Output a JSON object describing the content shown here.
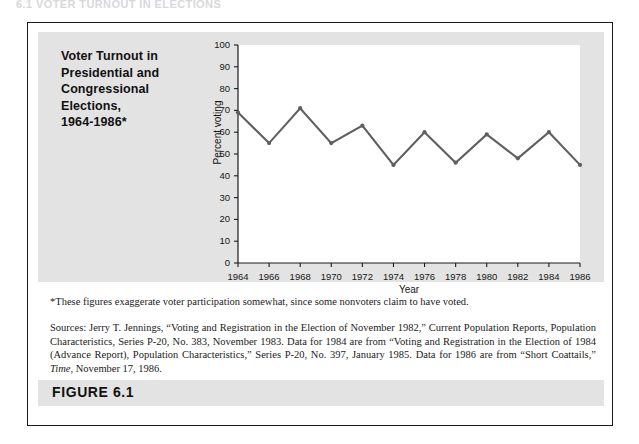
{
  "running_header": "6.1   VOTER TURNOUT IN ELECTIONS",
  "figure": {
    "caption": "FIGURE 6.1",
    "title_lines": [
      "Voter Turnout in",
      "Presidential and",
      "Congressional",
      "Elections,",
      "1964-1986*"
    ],
    "footnote": "*These figures exaggerate voter participation somewhat, since some nonvoters claim to have voted.",
    "sources_prefix": "Sources: Jerry T. Jennings, “Voting and Registration in the Election of November 1982,” Current Population Reports, Population Characteristics, Series P-20, No. 383, November 1983. Data for 1984 are from “Voting and Registration in the Election of 1984 (Advance Report), Population Characteristics,” Series P-20, No. 397, January 1985. Data for 1986 are from “Short Coattails,” ",
    "sources_italic": "Time",
    "sources_suffix": ", November 17, 1986."
  },
  "colors": {
    "panel_gray": "#e3e3e3",
    "line": "#5f5f5f",
    "axis": "#1a1a1a",
    "plot_background": "#ffffff",
    "page_background": "#ffffff"
  },
  "chart_data": {
    "type": "line",
    "title": "Voter Turnout in Presidential and Congressional Elections, 1964-1986*",
    "xlabel": "Year",
    "ylabel": "Percent voting",
    "x": [
      1964,
      1966,
      1968,
      1970,
      1972,
      1974,
      1976,
      1978,
      1980,
      1982,
      1984,
      1986
    ],
    "values": [
      69,
      55,
      71,
      55,
      63,
      45,
      60,
      46,
      59,
      48,
      60,
      45
    ],
    "series": [
      {
        "name": "Percent voting",
        "values": [
          69,
          55,
          71,
          55,
          63,
          45,
          60,
          46,
          59,
          48,
          60,
          45
        ]
      }
    ],
    "xtick_labels": [
      "1964",
      "1966",
      "1968",
      "1970",
      "1972",
      "1974",
      "1976",
      "1978",
      "1980",
      "1982",
      "1984",
      "1986"
    ],
    "ytick_labels": [
      "0",
      "10",
      "20",
      "30",
      "40",
      "50",
      "60",
      "70",
      "80",
      "90",
      "100"
    ],
    "yticks": [
      0,
      10,
      20,
      30,
      40,
      50,
      60,
      70,
      80,
      90,
      100
    ],
    "xlim": [
      1964,
      1986
    ],
    "ylim": [
      0,
      100
    ],
    "grid": false,
    "legend": false,
    "markers": true
  }
}
